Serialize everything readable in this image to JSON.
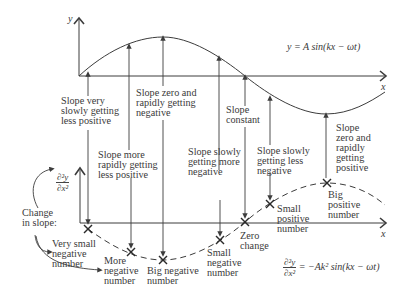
{
  "top_graph": {
    "y_axis_label": "y",
    "x_axis_label": "x",
    "equation": "y = A sin(kx − ωt)"
  },
  "bottom_graph": {
    "y_axis_label_num": "∂²y",
    "y_axis_label_den": "∂x²",
    "x_axis_label": "x",
    "equation_num": "∂²y",
    "equation_den": "∂x²",
    "equation_rhs": "= −Ak² sin(kx − ωt)"
  },
  "side_label": "Change\nin slope:",
  "slope_labels": [
    {
      "id": "very-slowly-less-positive",
      "text": "Slope very\nslowly getting\nless positive"
    },
    {
      "id": "more-rapidly-less-positive",
      "text": "Slope more\nrapidly getting\nless positive"
    },
    {
      "id": "zero-rapidly-negative",
      "text": "Slope zero and\nrapidly getting\nnegative"
    },
    {
      "id": "slowly-more-negative",
      "text": "Slope slowly\ngetting more\nnegative"
    },
    {
      "id": "constant",
      "text": "Slope\nconstant"
    },
    {
      "id": "slowly-less-negative",
      "text": "Slope slowly\ngetting less\nnegative"
    },
    {
      "id": "zero-rapidly-positive",
      "text": "Slope\nzero and\nrapidly\ngetting\npositive"
    }
  ],
  "change_labels": [
    {
      "id": "very-small-negative",
      "text": "Very small\nnegative\nnumber"
    },
    {
      "id": "more-negative",
      "text": "More\nnegative\nnumber"
    },
    {
      "id": "big-negative",
      "text": "Big negative\nnumber"
    },
    {
      "id": "small-negative",
      "text": "Small\nnegative\nnumber"
    },
    {
      "id": "zero-change",
      "text": "Zero\nchange"
    },
    {
      "id": "small-positive",
      "text": "Small\npositive\nnumber"
    },
    {
      "id": "big-positive",
      "text": "Big\npositive\nnumber"
    }
  ],
  "colors": {
    "line": "#3c3c3c",
    "text": "#3a3a3a",
    "background": "#ffffff"
  }
}
